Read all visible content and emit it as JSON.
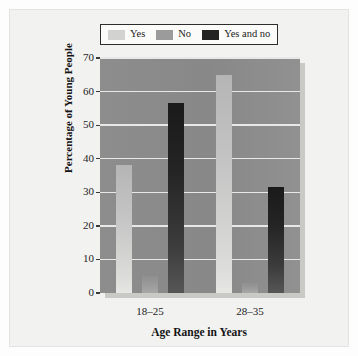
{
  "chart_data": {
    "type": "bar",
    "title": "",
    "subtitle": "",
    "xlabel": "Age Range in Years",
    "ylabel": "Percentage of Young People",
    "categories": [
      "18–25",
      "28–35"
    ],
    "series": [
      {
        "name": "Yes",
        "values": [
          38,
          65
        ],
        "color": "#d2d2d0"
      },
      {
        "name": "No",
        "values": [
          5,
          3
        ],
        "color": "#9b9b9b"
      },
      {
        "name": "Yes and no",
        "values": [
          56.5,
          31.5
        ],
        "color": "#232323"
      }
    ],
    "ylim": [
      0,
      70
    ],
    "yticks": [
      0,
      10,
      20,
      30,
      40,
      50,
      60,
      70
    ],
    "ytick_labels": [
      "0",
      "10",
      "20",
      "30",
      "40",
      "50",
      "60",
      "70"
    ],
    "grid": true,
    "grid_axis": "y",
    "legend_position": "top",
    "plot_background": "#8a8a8a",
    "figure_background": "#f2f2f1",
    "gridline_color": "#e8e8e6"
  },
  "legend": {
    "items": [
      {
        "label": "Yes",
        "swatch": "#d2d2d0"
      },
      {
        "label": "No",
        "swatch": "#9b9b9b"
      },
      {
        "label": "Yes and no",
        "swatch": "#232323"
      }
    ]
  },
  "axes": {
    "y_title": "Percentage of Young People",
    "x_title": "Age Range in Years",
    "y_tick_labels": [
      "70",
      "60",
      "50",
      "40",
      "30",
      "20",
      "10",
      "0"
    ],
    "x_tick_labels": [
      "18–25",
      "28–35"
    ]
  }
}
